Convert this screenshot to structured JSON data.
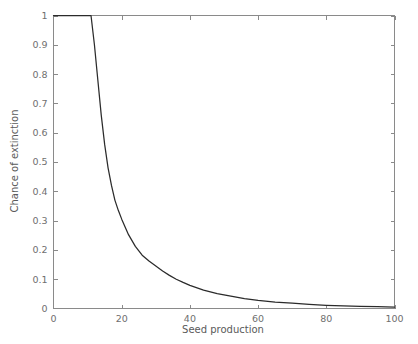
{
  "chart_data": {
    "type": "line",
    "title": "",
    "xlabel": "Seed production",
    "ylabel": "Chance of extinction",
    "xlim": [
      0,
      100
    ],
    "ylim": [
      0,
      1
    ],
    "grid": false,
    "legend": null,
    "xticks": [
      0,
      20,
      40,
      60,
      80,
      100
    ],
    "xtick_labels": [
      "0",
      "20",
      "40",
      "60",
      "80",
      "100"
    ],
    "yticks": [
      0,
      0.1,
      0.2,
      0.3,
      0.4,
      0.5,
      0.6,
      0.7,
      0.8,
      0.9,
      1
    ],
    "ytick_labels": [
      "0",
      "0.1",
      "0.2",
      "0.3",
      "0.4",
      "0.5",
      "0.6",
      "0.7",
      "0.8",
      "0.9",
      "1"
    ],
    "series": [
      {
        "name": "Chance of extinction",
        "color": "#2b2b2b",
        "x": [
          0,
          2,
          4,
          6,
          8,
          10,
          11,
          12,
          13,
          14,
          15,
          16,
          17,
          18,
          19,
          20,
          22,
          24,
          26,
          28,
          30,
          32,
          34,
          36,
          38,
          40,
          44,
          48,
          52,
          56,
          60,
          65,
          70,
          75,
          80,
          85,
          90,
          95,
          100
        ],
        "y": [
          1,
          1,
          1,
          1,
          1,
          1,
          1,
          0.9,
          0.78,
          0.66,
          0.56,
          0.48,
          0.42,
          0.37,
          0.335,
          0.305,
          0.252,
          0.212,
          0.182,
          0.162,
          0.145,
          0.128,
          0.113,
          0.1,
          0.089,
          0.079,
          0.063,
          0.051,
          0.042,
          0.034,
          0.028,
          0.022,
          0.018,
          0.014,
          0.011,
          0.009,
          0.007,
          0.006,
          0.005
        ]
      }
    ],
    "annotations": []
  },
  "axes": {
    "x_title": "Seed production",
    "y_title": "Chance of extinction"
  },
  "style": {
    "axis_color": "#8a8a8a",
    "curve_color": "#2b2b2b",
    "label_color": "#6f6f6f",
    "title_color": "#5a5a5a",
    "background": "#ffffff"
  }
}
